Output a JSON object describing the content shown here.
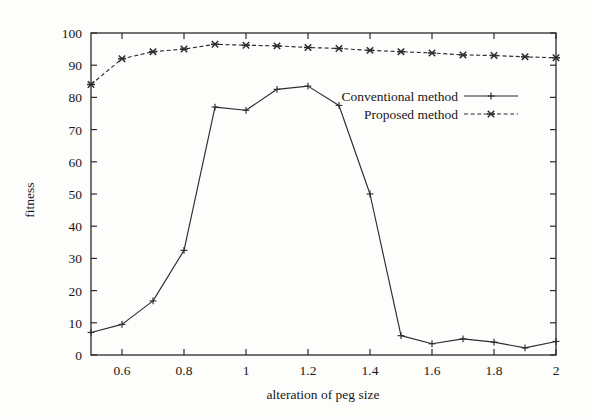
{
  "chart_data": {
    "type": "line",
    "title": "",
    "xlabel": "alteration of peg size",
    "ylabel": "fitness",
    "xlim": [
      0.5,
      2.0
    ],
    "ylim": [
      0,
      100
    ],
    "grid": false,
    "legend_position": "upper-right-inside",
    "xticks": [
      0.6,
      0.8,
      1,
      1.2,
      1.4,
      1.6,
      1.8,
      2
    ],
    "xtick_labels": [
      "0.6",
      "0.8",
      "1",
      "1.2",
      "1.4",
      "1.6",
      "1.8",
      "2"
    ],
    "yticks": [
      0,
      10,
      20,
      30,
      40,
      50,
      60,
      70,
      80,
      90,
      100
    ],
    "ytick_labels": [
      "0",
      "10",
      "20",
      "30",
      "40",
      "50",
      "60",
      "70",
      "80",
      "90",
      "100"
    ],
    "x": [
      0.5,
      0.6,
      0.7,
      0.8,
      0.9,
      1.0,
      1.1,
      1.2,
      1.3,
      1.4,
      1.5,
      1.6,
      1.7,
      1.8,
      1.9,
      2.0
    ],
    "series": [
      {
        "name": "Conventional method",
        "marker": "plus",
        "linestyle": "solid",
        "color": "#2d2d2d",
        "values": [
          7,
          9.5,
          16.8,
          32.5,
          77,
          76,
          82.5,
          83.5,
          77.5,
          50,
          6,
          3.5,
          5,
          4,
          2.2,
          4.2
        ]
      },
      {
        "name": "Proposed method",
        "marker": "cross",
        "linestyle": "dashed",
        "color": "#2d2d2d",
        "values": [
          84,
          92,
          94.2,
          95,
          96.5,
          96.2,
          96,
          95.5,
          95.2,
          94.6,
          94.2,
          93.8,
          93.2,
          93,
          92.6,
          92.3
        ]
      }
    ]
  },
  "legend": {
    "entries": [
      {
        "label": "Conventional method",
        "style": "solid-plus"
      },
      {
        "label": "Proposed method",
        "style": "dashed-cross"
      }
    ]
  },
  "axes": {
    "x_title": "alteration of peg size",
    "y_title": "fitness"
  }
}
